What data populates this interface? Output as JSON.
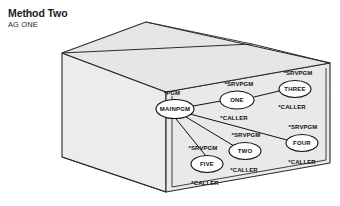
{
  "header": {
    "title": "Method Two",
    "subtitle": "AG ONE"
  },
  "illustration": {
    "name": "cardboard-box",
    "face_fill": "#e9e9e9",
    "top_fill": "#e4e4e4",
    "left_fill": "#ececec",
    "stroke": "#2b2b2b"
  },
  "graph": {
    "node_fill": "#ffffff",
    "node_stroke": "#111111",
    "edge_stroke": "#111111",
    "nodes": [
      {
        "id": "mainpgm",
        "label": "MAINPGM",
        "type_label": "*PGM",
        "binder_label": "",
        "cx": 175,
        "cy": 109,
        "rx": 19,
        "ry": 9.5
      },
      {
        "id": "one",
        "label": "ONE",
        "type_label": "*SRVPGM",
        "binder_label": "*CALLER",
        "cx": 237,
        "cy": 100,
        "rx": 17,
        "ry": 9.0
      },
      {
        "id": "three",
        "label": "THREE",
        "type_label": "*SRVPGM",
        "binder_label": "*CALLER",
        "cx": 295,
        "cy": 89,
        "rx": 16,
        "ry": 8.5
      },
      {
        "id": "two",
        "label": "TWO",
        "type_label": "*SRVPGM",
        "binder_label": "*CALLER",
        "cx": 245,
        "cy": 151,
        "rx": 16,
        "ry": 8.5
      },
      {
        "id": "four",
        "label": "FOUR",
        "type_label": "*SRVPGM",
        "binder_label": "*CALLER",
        "cx": 302,
        "cy": 143,
        "rx": 16,
        "ry": 8.5
      },
      {
        "id": "five",
        "label": "FIVE",
        "type_label": "*SRVPGM",
        "binder_label": "*CALLER",
        "cx": 207,
        "cy": 164,
        "rx": 16,
        "ry": 8.5
      }
    ],
    "edges": [
      {
        "from": "mainpgm",
        "to": "one"
      },
      {
        "from": "mainpgm",
        "to": "two"
      },
      {
        "from": "mainpgm",
        "to": "five"
      },
      {
        "from": "mainpgm",
        "to": "four"
      },
      {
        "from": "one",
        "to": "three"
      }
    ]
  }
}
